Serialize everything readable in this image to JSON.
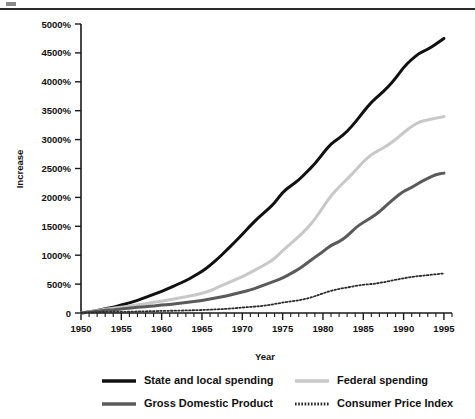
{
  "figure": {
    "top_rule": "horizontal-rule",
    "background_color": "#ffffff"
  },
  "chart_data": {
    "type": "line",
    "title": "",
    "subtitle": "",
    "xlabel": "Year",
    "ylabel": "Increase",
    "xlim": [
      1950,
      1996
    ],
    "ylim": [
      0,
      5000
    ],
    "grid": false,
    "legend_position": "bottom",
    "x_tick_labels": [
      "1950",
      "1955",
      "1960",
      "1965",
      "1970",
      "1975",
      "1980",
      "1985",
      "1990",
      "1995"
    ],
    "x_ticks": [
      1950,
      1955,
      1960,
      1965,
      1970,
      1975,
      1980,
      1985,
      1990,
      1995
    ],
    "x_minor_tick_step": 1,
    "y_tick_labels": [
      "0",
      "500%",
      "1000%",
      "1500%",
      "2000%",
      "2500%",
      "3000%",
      "3500%",
      "4000%",
      "4500%",
      "5000%"
    ],
    "y_ticks": [
      0,
      500,
      1000,
      1500,
      2000,
      2500,
      3000,
      3500,
      4000,
      4500,
      5000
    ],
    "x": [
      1950,
      1951,
      1952,
      1953,
      1954,
      1955,
      1956,
      1957,
      1958,
      1959,
      1960,
      1961,
      1962,
      1963,
      1964,
      1965,
      1966,
      1967,
      1968,
      1969,
      1970,
      1971,
      1972,
      1973,
      1974,
      1975,
      1976,
      1977,
      1978,
      1979,
      1980,
      1981,
      1982,
      1983,
      1984,
      1985,
      1986,
      1987,
      1988,
      1989,
      1990,
      1991,
      1992,
      1993,
      1994,
      1995
    ],
    "series": [
      {
        "name": "State and local spending",
        "color": "#111111",
        "style": "solid",
        "width": 3.0,
        "values": [
          0,
          20,
          45,
          70,
          100,
          135,
          175,
          220,
          270,
          320,
          375,
          435,
          495,
          560,
          635,
          720,
          820,
          945,
          1080,
          1215,
          1360,
          1510,
          1650,
          1770,
          1900,
          2090,
          2200,
          2300,
          2440,
          2580,
          2760,
          2930,
          3020,
          3140,
          3300,
          3480,
          3650,
          3770,
          3900,
          4060,
          4250,
          4390,
          4500,
          4560,
          4650,
          4750
        ]
      },
      {
        "name": "Federal spending",
        "color": "#c8c8c8",
        "style": "solid",
        "width": 3.0,
        "values": [
          0,
          18,
          40,
          62,
          82,
          100,
          118,
          140,
          162,
          185,
          205,
          228,
          255,
          280,
          308,
          340,
          385,
          445,
          510,
          570,
          630,
          700,
          775,
          850,
          940,
          1080,
          1200,
          1320,
          1460,
          1620,
          1830,
          2030,
          2180,
          2320,
          2460,
          2620,
          2740,
          2820,
          2900,
          3000,
          3120,
          3230,
          3310,
          3340,
          3370,
          3400
        ]
      },
      {
        "name": "Gross Domestic Product",
        "color": "#5a5a5a",
        "style": "solid",
        "width": 3.0,
        "values": [
          0,
          15,
          30,
          45,
          55,
          70,
          85,
          100,
          110,
          125,
          138,
          150,
          165,
          180,
          198,
          218,
          242,
          265,
          295,
          330,
          360,
          400,
          445,
          500,
          550,
          605,
          680,
          760,
          860,
          965,
          1060,
          1175,
          1230,
          1330,
          1470,
          1570,
          1650,
          1750,
          1880,
          2000,
          2110,
          2170,
          2260,
          2330,
          2400,
          2420
        ]
      },
      {
        "name": "Consumer Price Index",
        "color": "#2b2b2b",
        "style": "dotted",
        "width": 1.8,
        "values": [
          0,
          8,
          16,
          18,
          20,
          20,
          22,
          26,
          30,
          32,
          36,
          38,
          41,
          44,
          48,
          52,
          58,
          64,
          72,
          82,
          94,
          106,
          116,
          130,
          155,
          180,
          200,
          220,
          248,
          290,
          340,
          385,
          418,
          440,
          468,
          490,
          500,
          520,
          545,
          575,
          600,
          625,
          640,
          655,
          670,
          685
        ]
      }
    ],
    "legend_entries": [
      {
        "label": "State and local spending",
        "color": "#111111",
        "style": "solid"
      },
      {
        "label": "Federal spending",
        "color": "#c8c8c8",
        "style": "solid"
      },
      {
        "label": "Gross Domestic Product",
        "color": "#5a5a5a",
        "style": "solid"
      },
      {
        "label": "Consumer Price Index",
        "color": "#2b2b2b",
        "style": "dotted"
      }
    ]
  }
}
